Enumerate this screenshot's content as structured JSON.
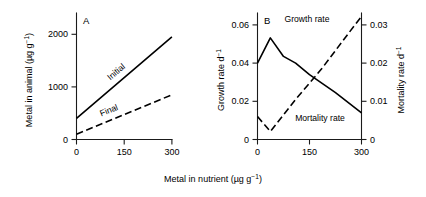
{
  "figure": {
    "panels": [
      {
        "letter": "A",
        "xlabel_shared": true,
        "ylabel": "Metal in animal (µg g",
        "ylabel_sup": "−1",
        "ylabel_tail": ")",
        "yticks": [
          "0",
          "1000",
          "2000"
        ],
        "xticks": [
          "0",
          "150",
          "300"
        ],
        "series_labels": [
          "Initial",
          "Final"
        ]
      },
      {
        "letter": "B",
        "ylabel_left": "Growth rate d",
        "ylabel_left_sup": "−1",
        "ylabel_right": "Mortality rate d",
        "ylabel_right_sup": "−1",
        "yticks_left": [
          "0",
          "0.02",
          "0.04",
          "0.06"
        ],
        "yticks_right": [
          "0",
          "0.01",
          "0.02",
          "0.03"
        ],
        "xticks": [
          "0",
          "150",
          "300"
        ],
        "series_labels": [
          "Growth rate",
          "Mortality rate"
        ]
      }
    ],
    "xlabel": "Metal in nutrient (µg g",
    "xlabel_sup": "−1",
    "xlabel_tail": ")",
    "colors": {
      "ink": "#000000",
      "axis": "#1a1a1a",
      "background": "#ffffff"
    }
  },
  "chart_data": [
    {
      "type": "line",
      "title": "A",
      "xlabel": "Metal in nutrient (µg g⁻¹)",
      "ylabel": "Metal in animal (µg g⁻¹)",
      "xlim": [
        -20,
        320
      ],
      "ylim": [
        0,
        2400
      ],
      "xticks": [
        0,
        150,
        300
      ],
      "yticks": [
        0,
        1000,
        2000
      ],
      "grid": false,
      "legend": "inline-curve-labels",
      "series": [
        {
          "name": "Initial",
          "style": "solid",
          "x": [
            0,
            150,
            300
          ],
          "values": [
            400,
            1175,
            1950
          ]
        },
        {
          "name": "Final",
          "style": "dashed",
          "x": [
            0,
            150,
            300
          ],
          "values": [
            100,
            475,
            850
          ]
        }
      ]
    },
    {
      "type": "line",
      "title": "B",
      "xlabel": "Metal in nutrient (µg g⁻¹)",
      "ylabel": "Growth rate d⁻¹",
      "ylabel_secondary": "Mortality rate d⁻¹",
      "xlim": [
        -20,
        320
      ],
      "ylim": [
        0,
        0.066
      ],
      "ylim_secondary": [
        0,
        0.033
      ],
      "xticks": [
        0,
        150,
        300
      ],
      "yticks": [
        0,
        0.02,
        0.04,
        0.06
      ],
      "yticks_secondary": [
        0,
        0.01,
        0.02,
        0.03
      ],
      "grid": false,
      "legend": "inline-curve-labels",
      "series": [
        {
          "name": "Growth rate",
          "style": "solid",
          "axis": "left",
          "x": [
            0,
            37,
            75,
            110,
            150,
            225,
            300
          ],
          "values": [
            0.04,
            0.0532,
            0.0435,
            0.04,
            0.034,
            0.0245,
            0.014
          ]
        },
        {
          "name": "Mortality rate",
          "style": "dashed",
          "axis": "right",
          "x": [
            0,
            37,
            110,
            185,
            260,
            300
          ],
          "values": [
            0.006,
            0.0021,
            0.0105,
            0.0185,
            0.0275,
            0.0322
          ]
        }
      ]
    }
  ]
}
